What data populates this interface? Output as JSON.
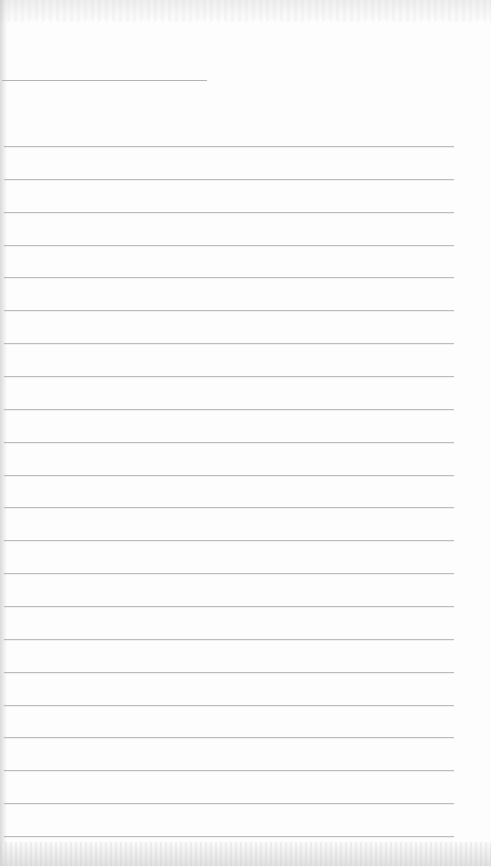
{
  "document": {
    "type": "lined-paper-form",
    "header_line": {
      "y": 80,
      "x_start": 2,
      "x_end": 207
    },
    "ruled_lines": {
      "count": 22,
      "first_y": 146,
      "spacing": 32.86,
      "x_start": 4,
      "x_end": 454
    },
    "colors": {
      "paper": "#fdfdfd",
      "line": "#bcbcbc",
      "header_line": "#b4b4b4"
    },
    "text_content": []
  }
}
